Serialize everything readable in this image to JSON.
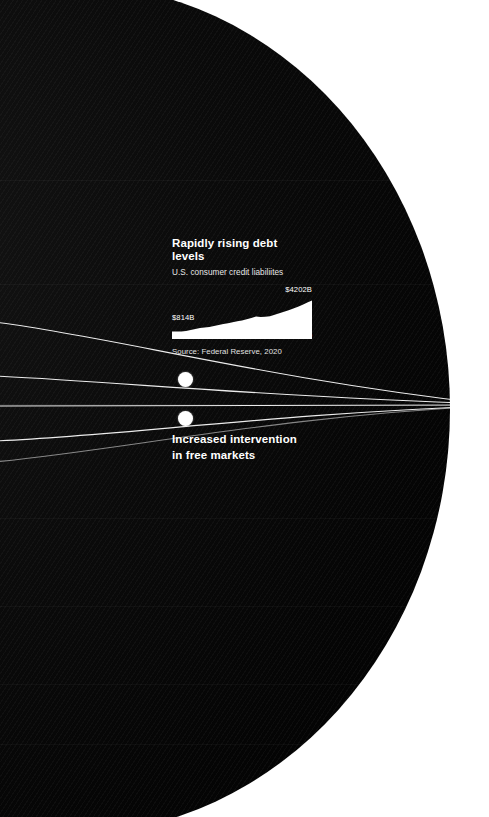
{
  "canvas": {
    "width": 489,
    "height": 817,
    "background": "#ffffff",
    "sphere_color": "#0b0b0b",
    "accent_color": "#ffffff"
  },
  "callout": {
    "title": "Rapidly rising debt levels",
    "subtitle": "U.S. consumer credit liabiliites",
    "source": "Source: Federal Reserve, 2020",
    "max_label": "$4202B",
    "min_label": "$814B",
    "axis_start": "1990",
    "axis_end": "2020"
  },
  "label_block": {
    "line1": "Increased intervention",
    "line2": "in free markets"
  },
  "nodes": [
    {
      "name": "node-debt-levels",
      "x": 178,
      "y": 372
    },
    {
      "name": "node-free-markets",
      "x": 178,
      "y": 411
    }
  ],
  "chart_data": {
    "type": "area",
    "title": "Rapidly rising debt levels",
    "subtitle": "U.S. consumer credit liabiliites",
    "xlabel": "",
    "ylabel": "",
    "units": "Billions of USD",
    "source": "Source: Federal Reserve, 2020",
    "xlim": [
      1990,
      2020
    ],
    "ylim": [
      0,
      4202
    ],
    "grid": false,
    "legend": "none",
    "annotations": [
      "$814B",
      "$4202B"
    ],
    "x": [
      1990,
      1991,
      1992,
      1993,
      1994,
      1995,
      1996,
      1997,
      1998,
      1999,
      2000,
      2001,
      2002,
      2003,
      2004,
      2005,
      2006,
      2007,
      2008,
      2009,
      2010,
      2011,
      2012,
      2013,
      2014,
      2015,
      2016,
      2017,
      2018,
      2019,
      2020
    ],
    "values": [
      814,
      808,
      820,
      870,
      980,
      1095,
      1190,
      1260,
      1320,
      1420,
      1530,
      1630,
      1720,
      1820,
      1930,
      2030,
      2150,
      2300,
      2450,
      2400,
      2420,
      2490,
      2640,
      2800,
      2980,
      3150,
      3330,
      3530,
      3750,
      3990,
      4202
    ],
    "series": [
      {
        "name": "U.S. consumer credit liabiliites",
        "values": [
          814,
          808,
          820,
          870,
          980,
          1095,
          1190,
          1260,
          1320,
          1420,
          1530,
          1630,
          1720,
          1820,
          1930,
          2030,
          2150,
          2300,
          2450,
          2400,
          2420,
          2490,
          2640,
          2800,
          2980,
          3150,
          3330,
          3530,
          3750,
          3990,
          4202
        ]
      }
    ]
  }
}
